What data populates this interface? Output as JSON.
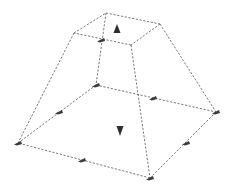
{
  "diagram": {
    "title": "",
    "type": "frustum-wireframe",
    "colors": {
      "background": "#ffffff",
      "edge": "#6a6a6a",
      "marker": "#3c3c3c",
      "arrow": "#2e2e2e"
    },
    "vertices": {
      "top_back": [
        106,
        13
      ],
      "top_right": [
        160,
        24
      ],
      "top_front": [
        131,
        45
      ],
      "top_left": [
        74,
        33
      ],
      "bottom_back": [
        96,
        85
      ],
      "bottom_right": [
        216,
        112
      ],
      "bottom_front": [
        150,
        178
      ],
      "bottom_left": [
        18,
        143
      ]
    },
    "edges": [
      [
        "top_back",
        "top_right"
      ],
      [
        "top_right",
        "top_front"
      ],
      [
        "top_front",
        "top_left"
      ],
      [
        "top_left",
        "top_back"
      ],
      [
        "bottom_back",
        "bottom_right"
      ],
      [
        "bottom_right",
        "bottom_front"
      ],
      [
        "bottom_front",
        "bottom_left"
      ],
      [
        "bottom_left",
        "bottom_back"
      ],
      [
        "top_back",
        "bottom_back"
      ],
      [
        "top_right",
        "bottom_right"
      ],
      [
        "top_front",
        "bottom_front"
      ],
      [
        "top_left",
        "bottom_left"
      ]
    ],
    "markers": [
      {
        "name": "marker-top-front-left-edge",
        "pos": [
          101,
          40
        ]
      },
      {
        "name": "marker-bottom-back-vertex",
        "pos": [
          96,
          85
        ]
      },
      {
        "name": "marker-bottom-left-back-edge",
        "pos": [
          59,
          112
        ]
      },
      {
        "name": "marker-bottom-back-right-edge",
        "pos": [
          153,
          98
        ]
      },
      {
        "name": "marker-bottom-right-vertex",
        "pos": [
          216,
          112
        ]
      },
      {
        "name": "marker-bottom-right-front-edge",
        "pos": [
          186,
          143
        ]
      },
      {
        "name": "marker-bottom-front-vertex",
        "pos": [
          150,
          178
        ]
      },
      {
        "name": "marker-bottom-front-left-edge",
        "pos": [
          82,
          160
        ]
      },
      {
        "name": "marker-bottom-left-vertex",
        "pos": [
          18,
          143
        ]
      }
    ],
    "arrows": [
      {
        "name": "up-arrow-top-face",
        "direction": "up",
        "pos": [
          117,
          29
        ]
      },
      {
        "name": "down-arrow-bottom-face",
        "direction": "down",
        "pos": [
          120,
          131
        ]
      }
    ]
  }
}
